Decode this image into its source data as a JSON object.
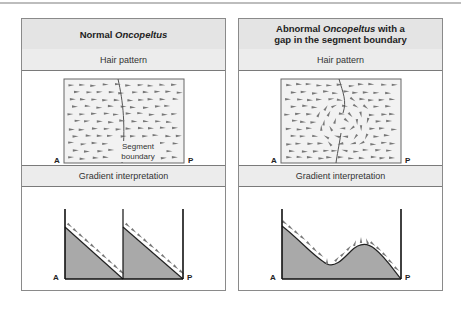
{
  "figure": {
    "panels": [
      {
        "id": "normal",
        "title_prefix": "Normal ",
        "title_italic": "Oncopeltus",
        "title_suffix": "",
        "title_line2": "",
        "hair_pattern_label": "Hair pattern",
        "gradient_label": "Gradient interpretation",
        "segment_boundary_label_line1": "Segment",
        "segment_boundary_label_line2": "boundary",
        "axis_left": "A",
        "axis_right": "P"
      },
      {
        "id": "abnormal",
        "title_prefix": "Abnormal ",
        "title_italic": "Oncopeltus",
        "title_suffix": " with a",
        "title_line2": "gap in the segment boundary",
        "hair_pattern_label": "Hair pattern",
        "gradient_label": "Gradient interpretation",
        "axis_left": "A",
        "axis_right": "P"
      }
    ],
    "colors": {
      "header_bg": "#e4e4e4",
      "subheader_bg": "#ececec",
      "hair_field_bg": "#f2f2f2",
      "gradient_fill": "#a9a9a9",
      "hair_mark": "#777777",
      "border": "#8a8a8a"
    }
  }
}
